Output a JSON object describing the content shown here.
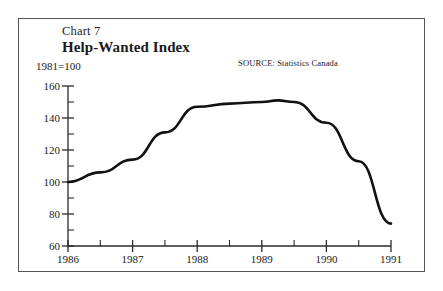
{
  "chart_data": {
    "type": "line",
    "title": "Help-Wanted Index",
    "chart_number": "Chart 7",
    "subtitle": "1981=100",
    "source": "SOURCE: Statistics Canada",
    "xlabel": "",
    "ylabel": "",
    "ylim": [
      60,
      160
    ],
    "xlim": [
      1986,
      1991
    ],
    "grid": false,
    "legend": "none",
    "y_ticks": [
      160,
      140,
      120,
      100,
      80,
      60
    ],
    "y_tick_labels": [
      "160",
      "140",
      "120",
      "100",
      "80",
      "60"
    ],
    "y_minor_tick_step": 10,
    "x_ticks": [
      1986,
      1987,
      1988,
      1989,
      1990,
      1991
    ],
    "x_tick_labels": [
      "1986",
      "1987",
      "1988",
      "1989",
      "1990",
      "1991"
    ],
    "x_minor_tick_step": 0.5,
    "line_color": "#111111",
    "line_width": 2.6,
    "x": [
      1986.0,
      1986.5,
      1987.0,
      1987.5,
      1988.0,
      1988.5,
      1989.0,
      1989.25,
      1989.5,
      1990.0,
      1990.5,
      1991.0
    ],
    "values": [
      100,
      106,
      114,
      131,
      147,
      149,
      150,
      151,
      150,
      137,
      113,
      74
    ],
    "series": [
      {
        "name": "Help-Wanted Index",
        "values": [
          100,
          106,
          114,
          131,
          147,
          149,
          150,
          151,
          150,
          137,
          113,
          74
        ]
      }
    ]
  }
}
